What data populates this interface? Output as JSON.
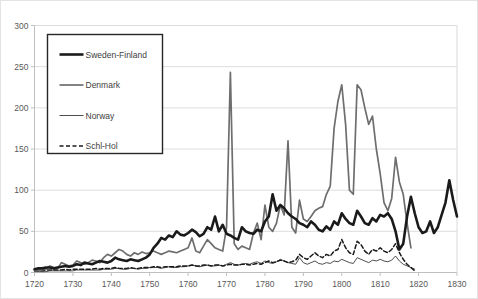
{
  "chart_data": {
    "type": "line",
    "title": "",
    "subtitle": "",
    "xlabel": "",
    "ylabel": "",
    "xlim": [
      1720,
      1830
    ],
    "ylim": [
      0,
      300
    ],
    "grid": true,
    "legend_position": "upper-left",
    "xticks": [
      "1720",
      "1730",
      "1740",
      "1750",
      "1760",
      "1770",
      "1780",
      "1790",
      "1800",
      "1810",
      "1820",
      "1830"
    ],
    "yticks": [
      "0",
      "50",
      "100",
      "150",
      "200",
      "250",
      "300"
    ],
    "legend": [
      {
        "label": "Sweden-Finland",
        "color": "#1a1a1a",
        "width": 2.6,
        "dash": "none"
      },
      {
        "label": "Denmark",
        "color": "#6e6e6e",
        "width": 1.7,
        "dash": "none"
      },
      {
        "label": "Norway",
        "color": "#3a3a3a",
        "width": 0.9,
        "dash": "none"
      },
      {
        "label": "Schl-Hol",
        "color": "#1a1a1a",
        "width": 1.5,
        "dash": "4,2.5"
      }
    ],
    "x": [
      1720,
      1721,
      1722,
      1723,
      1724,
      1725,
      1726,
      1727,
      1728,
      1729,
      1730,
      1731,
      1732,
      1733,
      1734,
      1735,
      1736,
      1737,
      1738,
      1739,
      1740,
      1741,
      1742,
      1743,
      1744,
      1745,
      1746,
      1747,
      1748,
      1749,
      1750,
      1751,
      1752,
      1753,
      1754,
      1755,
      1756,
      1757,
      1758,
      1759,
      1760,
      1761,
      1762,
      1763,
      1764,
      1765,
      1766,
      1767,
      1768,
      1769,
      1770,
      1771,
      1772,
      1773,
      1774,
      1775,
      1776,
      1777,
      1778,
      1779,
      1780,
      1781,
      1782,
      1783,
      1784,
      1785,
      1786,
      1787,
      1788,
      1789,
      1790,
      1791,
      1792,
      1793,
      1794,
      1795,
      1796,
      1797,
      1798,
      1799,
      1800,
      1801,
      1802,
      1803,
      1804,
      1805,
      1806,
      1807,
      1808,
      1809,
      1810,
      1811,
      1812,
      1813,
      1814,
      1815,
      1816,
      1817,
      1818,
      1819,
      1820,
      1821,
      1822,
      1823,
      1824,
      1825,
      1826,
      1827,
      1828,
      1829,
      1830
    ],
    "series": [
      {
        "name": "Sweden-Finland",
        "values": [
          4,
          5,
          5,
          6,
          6,
          5,
          6,
          7,
          8,
          7,
          8,
          10,
          9,
          12,
          11,
          10,
          12,
          14,
          13,
          12,
          14,
          18,
          16,
          15,
          14,
          16,
          15,
          14,
          16,
          18,
          22,
          30,
          35,
          42,
          40,
          45,
          43,
          50,
          46,
          45,
          48,
          52,
          49,
          44,
          47,
          55,
          52,
          68,
          50,
          58,
          47,
          45,
          42,
          40,
          55,
          50,
          48,
          47,
          52,
          50,
          62,
          68,
          95,
          75,
          82,
          78,
          72,
          68,
          65,
          60,
          58,
          55,
          62,
          58,
          52,
          50,
          56,
          52,
          62,
          58,
          72,
          65,
          60,
          58,
          75,
          68,
          60,
          58,
          66,
          62,
          70,
          68,
          72,
          65,
          50,
          28,
          35,
          68,
          92,
          72,
          55,
          48,
          50,
          62,
          48,
          55,
          70,
          85,
          112,
          88,
          68
        ]
      },
      {
        "name": "Denmark",
        "values": [
          2,
          3,
          3,
          4,
          8,
          6,
          5,
          12,
          10,
          8,
          9,
          14,
          12,
          10,
          12,
          15,
          14,
          12,
          18,
          22,
          20,
          24,
          28,
          26,
          22,
          20,
          24,
          22,
          25,
          23,
          24,
          26,
          24,
          22,
          24,
          26,
          25,
          24,
          26,
          28,
          30,
          42,
          26,
          24,
          32,
          40,
          35,
          30,
          28,
          26,
          55,
          243,
          35,
          28,
          32,
          30,
          28,
          48,
          60,
          40,
          82,
          55,
          50,
          60,
          82,
          70,
          160,
          55,
          48,
          88,
          65,
          62,
          68,
          75,
          78,
          80,
          95,
          105,
          175,
          208,
          228,
          180,
          100,
          95,
          228,
          222,
          200,
          180,
          190,
          150,
          120,
          85,
          75,
          90,
          140,
          110,
          95,
          60,
          30,
          0,
          0,
          0,
          0,
          0,
          0,
          0,
          0,
          0,
          0,
          0,
          0
        ]
      },
      {
        "name": "Norway",
        "values": [
          1,
          1,
          1,
          1,
          2,
          2,
          2,
          2,
          2,
          2,
          2,
          3,
          3,
          3,
          3,
          3,
          3,
          3,
          4,
          4,
          4,
          5,
          5,
          4,
          4,
          5,
          5,
          4,
          5,
          5,
          6,
          6,
          6,
          5,
          6,
          7,
          6,
          6,
          7,
          7,
          8,
          9,
          8,
          7,
          8,
          9,
          8,
          8,
          9,
          8,
          10,
          12,
          10,
          9,
          10,
          11,
          10,
          12,
          13,
          11,
          14,
          12,
          11,
          13,
          16,
          14,
          12,
          11,
          10,
          18,
          12,
          10,
          12,
          14,
          11,
          10,
          12,
          11,
          14,
          13,
          16,
          14,
          12,
          11,
          18,
          16,
          14,
          12,
          15,
          14,
          16,
          14,
          13,
          15,
          20,
          14,
          10,
          8,
          6,
          4,
          0,
          0,
          0,
          0,
          0,
          0,
          0,
          0,
          0,
          0,
          0
        ]
      },
      {
        "name": "Schl-Hol",
        "values": [
          2,
          2,
          2,
          3,
          3,
          3,
          3,
          3,
          4,
          3,
          4,
          4,
          4,
          4,
          4,
          4,
          5,
          4,
          5,
          5,
          5,
          6,
          5,
          5,
          5,
          6,
          5,
          5,
          6,
          6,
          6,
          7,
          7,
          6,
          7,
          7,
          7,
          7,
          8,
          8,
          8,
          9,
          8,
          8,
          9,
          9,
          8,
          9,
          9,
          8,
          9,
          10,
          9,
          9,
          10,
          10,
          9,
          10,
          11,
          10,
          12,
          14,
          12,
          13,
          15,
          14,
          12,
          13,
          15,
          22,
          18,
          16,
          20,
          24,
          20,
          18,
          22,
          20,
          26,
          28,
          40,
          30,
          24,
          22,
          38,
          34,
          26,
          22,
          28,
          26,
          30,
          26,
          24,
          28,
          35,
          24,
          16,
          10,
          6,
          2,
          0,
          0,
          0,
          0,
          0,
          0,
          0,
          0,
          0,
          0,
          0
        ]
      }
    ]
  }
}
